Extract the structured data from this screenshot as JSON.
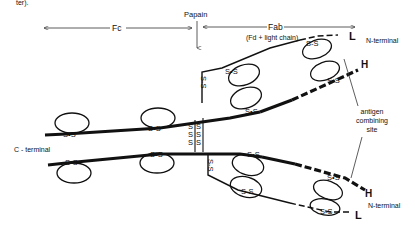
{
  "caption_fragment": "ter).",
  "labels": {
    "fc": "Fc",
    "papain": "Papain",
    "fab": "Fab",
    "fab_sub": "(Fd + light chain)",
    "n_terminal_top": "N-terminal",
    "n_terminal_bottom": "N-terminal",
    "c_terminal": "C - terminal",
    "antigen_site": [
      "antigen",
      "combining",
      "site"
    ],
    "heavy_top": "H",
    "light_top": "L",
    "heavy_bottom": "H",
    "light_bottom": "L",
    "disulfide": "S-S",
    "disulfide_bond": "S•S"
  }
}
